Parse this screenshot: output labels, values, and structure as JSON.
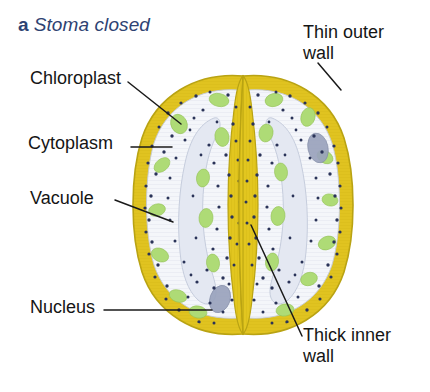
{
  "figure": {
    "part_letter": "a",
    "part_name": "Stoma closed",
    "title_color": "#2e4272"
  },
  "labels": {
    "chloroplast": "Chloroplast",
    "cytoplasm": "Cytoplasm",
    "vacuole": "Vacuole",
    "nucleus": "Nucleus",
    "thin_outer_wall": "Thin outer\nwall",
    "thick_inner_wall": "Thick inner\nwall"
  },
  "colors": {
    "cell_wall_yellow": "#e0c320",
    "cell_wall_yellow_dark": "#c9ae17",
    "cytoplasm_pale": "#f2f4f8",
    "vacuole_blue_white": "#e4e8f2",
    "chloroplast_green": "#aedb76",
    "nucleus_gray_blue": "#9aa3bd",
    "cytoplasm_dot": "#2a3358",
    "leader_line": "#1a1a1a",
    "outline": "#b9a313",
    "background": "#ffffff"
  },
  "diagram": {
    "type": "biological-cross-section",
    "state": "closed",
    "guard_cell_count": 2,
    "pore_open": false,
    "structures": [
      "thin outer wall",
      "thick inner wall",
      "cytoplasm",
      "vacuole",
      "chloroplast",
      "nucleus"
    ]
  }
}
